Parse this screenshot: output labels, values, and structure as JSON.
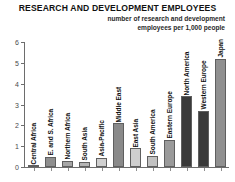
{
  "chart_data": {
    "type": "bar",
    "title": "RESEARCH AND DEVELOPMENT EMPLOYEES",
    "subtitle_line1": "number of research and development",
    "subtitle_line2": "employees per 1,000 people",
    "xlabel": "",
    "ylabel": "",
    "ylim": [
      0,
      6
    ],
    "yticks": [
      0,
      1,
      2,
      3,
      4,
      5,
      6
    ],
    "ytick_labels": [
      "0",
      "1",
      "2",
      "3",
      "4",
      "5",
      "6"
    ],
    "grid": false,
    "legend": "none",
    "categories": [
      "Central Africa",
      "E. and S. Africa",
      "Northern Africa",
      "South Asia",
      "Asia-Pacific",
      "Middle East",
      "East Asia",
      "South America",
      "Eastern Europe",
      "North America",
      "Western Europe",
      "Japan"
    ],
    "values": [
      0.05,
      0.5,
      0.3,
      0.25,
      0.45,
      2.1,
      0.9,
      0.55,
      1.3,
      3.4,
      2.7,
      5.2
    ],
    "bar_colors": [
      "#6f6f6f",
      "#8f8f8f",
      "#a6a6a6",
      "#b5b5b5",
      "#d0d0d0",
      "#8a8a8a",
      "#cfcfcf",
      "#c2c2c2",
      "#9a9a9a",
      "#3a3a3a",
      "#3a3a3a",
      "#909090"
    ],
    "axis_color": "#6d6d6d",
    "background": "#ffffff"
  }
}
